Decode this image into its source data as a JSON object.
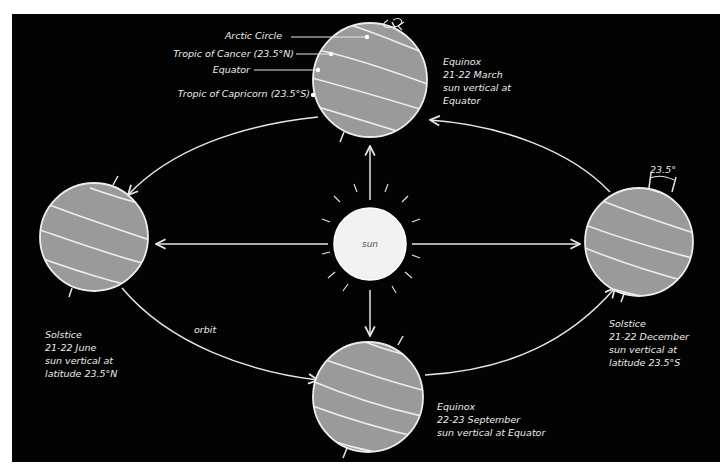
{
  "diagram": {
    "sun": {
      "label": "sun",
      "fill": "#f2f2f2"
    },
    "orbit_label": "orbit",
    "axial_tilt_label": "23.5°",
    "latitude_labels": {
      "arctic_circle": "Arctic Circle",
      "tropic_of_cancer": "Tropic of Cancer (23.5°N)",
      "equator": "Equator",
      "tropic_of_capricorn": "Tropic of Capricorn (23.5°S)"
    },
    "positions": [
      {
        "id": "march",
        "lines": [
          "Equinox",
          "21-22 March",
          "sun vertical at",
          "Equator"
        ]
      },
      {
        "id": "june",
        "lines": [
          "Solstice",
          "21-22 June",
          "sun vertical at",
          "latitude 23.5°N"
        ]
      },
      {
        "id": "september",
        "lines": [
          "Equinox",
          "22-23 September",
          "sun vertical at Equator"
        ]
      },
      {
        "id": "december",
        "lines": [
          "Solstice",
          "21-22 December",
          "sun vertical at",
          "latitude 23.5°S"
        ]
      }
    ],
    "colors": {
      "background": "#030303",
      "earth": "#9a9a9a",
      "lines": "#ededed"
    }
  }
}
